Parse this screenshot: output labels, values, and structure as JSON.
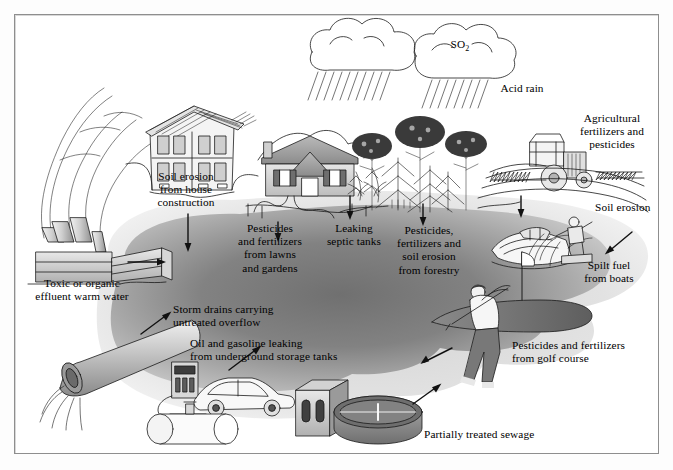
{
  "figure": {
    "kind": "water-pollution-sources-diagram",
    "border_color": "#8e8e8e",
    "background": "#ffffff",
    "plume_dark": "#7c7c7c",
    "plume_mid": "#a6a6a6",
    "plume_light": "#d9d9d9",
    "ink": "#1a1a1a"
  },
  "labels": {
    "acid_rain": "Acid rain",
    "so2": "SO",
    "so2_sub": "2",
    "soil_erosion_house": "Soil erosion\nfrom house\nconstruction",
    "toxic_effluent": "Toxic or organic\neffluent warm water",
    "pesticides_lawns": "Pesticides\nand fertilizers\nfrom lawns\nand gardens",
    "leaking_septic": "Leaking\nseptic tanks",
    "pesticides_forestry": "Pesticides,\nfertilizers and\nsoil erosion\nfrom forestry",
    "agricultural": "Agricultural\nfertilizers and\npesticides",
    "soil_erosion": "Soil erosion",
    "spilt_fuel": "Spilt fuel\nfrom boats",
    "storm_drains": "Storm drains carrying\nuntreated overflow",
    "oil_gasoline": "Oil and gasoline leaking\nfrom underground storage tanks",
    "golf_course": "Pesticides and fertilizers\nfrom golf course",
    "sewage": "Partially treated sewage"
  },
  "scene_objects": [
    {
      "name": "rain-cloud-left",
      "type": "cloud"
    },
    {
      "name": "rain-cloud-right",
      "type": "cloud"
    },
    {
      "name": "factory",
      "type": "industrial"
    },
    {
      "name": "house-under-construction",
      "type": "building"
    },
    {
      "name": "suburban-house",
      "type": "building"
    },
    {
      "name": "forest",
      "type": "vegetation"
    },
    {
      "name": "tractor",
      "type": "vehicle"
    },
    {
      "name": "speedboat",
      "type": "vehicle"
    },
    {
      "name": "water-skier",
      "type": "person"
    },
    {
      "name": "golfer",
      "type": "person"
    },
    {
      "name": "golf-green",
      "type": "terrain"
    },
    {
      "name": "gas-pump",
      "type": "equipment"
    },
    {
      "name": "car",
      "type": "vehicle"
    },
    {
      "name": "underground-storage-tank",
      "type": "equipment"
    },
    {
      "name": "sewage-plant-building",
      "type": "building"
    },
    {
      "name": "sewage-clarifier",
      "type": "equipment"
    },
    {
      "name": "outfall-pipe",
      "type": "equipment"
    },
    {
      "name": "pollution-plume",
      "type": "water"
    }
  ]
}
